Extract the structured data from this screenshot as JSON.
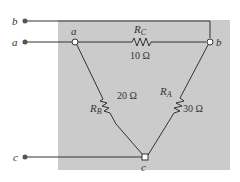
{
  "diagram": {
    "terminals": [
      {
        "id": "b",
        "label": "b"
      },
      {
        "id": "a",
        "label": "a"
      },
      {
        "id": "c",
        "label": "c"
      }
    ],
    "nodes": [
      {
        "id": "a",
        "label": "a"
      },
      {
        "id": "b",
        "label": "b"
      },
      {
        "id": "c",
        "label": "c"
      }
    ],
    "resistors": [
      {
        "name": "R",
        "sub": "C",
        "value": "10 Ω",
        "between": "a-b"
      },
      {
        "name": "R",
        "sub": "B",
        "value": "20 Ω",
        "between": "a-c"
      },
      {
        "name": "R",
        "sub": "A",
        "value": "30 Ω",
        "between": "b-c"
      }
    ],
    "colors": {
      "background_box": "#c8c8c8",
      "wire": "#333333"
    }
  }
}
